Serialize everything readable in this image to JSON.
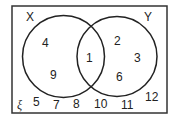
{
  "diagram": {
    "type": "venn",
    "universal_symbol": "ξ",
    "sets": [
      {
        "name": "X",
        "label": "X"
      },
      {
        "name": "Y",
        "label": "Y"
      }
    ],
    "regions": {
      "x_only": [
        "4",
        "9"
      ],
      "intersection": [
        "1"
      ],
      "y_only": [
        "2",
        "3",
        "6"
      ],
      "outside": [
        "5",
        "7",
        "8",
        "10",
        "11",
        "12"
      ]
    }
  },
  "colors": {
    "stroke": "#222222",
    "background": "#ffffff",
    "text": "#222222"
  }
}
